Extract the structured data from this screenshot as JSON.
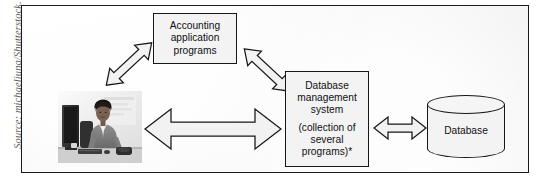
{
  "figure": {
    "source_credit": "Source: michaeljung/Shutterstock.",
    "frame_border_color": "#1a1a1a",
    "panel_background": "#f4f4f4",
    "ink_color": "#17171a"
  },
  "nodes": {
    "accounting": {
      "name": "accounting-application-programs",
      "lines": [
        "Accounting",
        "application",
        "programs"
      ]
    },
    "dbms": {
      "name": "database-management-system",
      "lines_primary": [
        "Database",
        "management",
        "system"
      ],
      "lines_secondary": [
        "(collection of",
        "several",
        "programs)*"
      ]
    },
    "database": {
      "name": "database-cylinder",
      "label": "Database"
    },
    "user": {
      "name": "user-at-computer-photo",
      "alt": "Woman working at a desktop computer"
    }
  },
  "connectors": [
    {
      "id": "user-to-accounting",
      "from": "user",
      "to": "accounting",
      "style": "double-headed",
      "orientation": "diagonal-up-right"
    },
    {
      "id": "accounting-to-dbms",
      "from": "accounting",
      "to": "dbms",
      "style": "double-headed",
      "orientation": "diagonal-down-right"
    },
    {
      "id": "user-to-dbms",
      "from": "user",
      "to": "dbms",
      "style": "double-headed",
      "orientation": "horizontal"
    },
    {
      "id": "dbms-to-database",
      "from": "dbms",
      "to": "database",
      "style": "double-headed",
      "orientation": "horizontal"
    }
  ]
}
